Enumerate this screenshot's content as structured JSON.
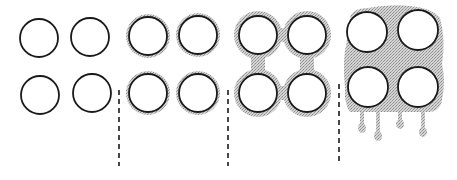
{
  "diagram": {
    "colors": {
      "stroke": "#1a1a1a",
      "fill_shade": "#b8b8b8",
      "background": "#ffffff"
    },
    "stages": [
      {
        "id": "stage-1",
        "label": "dry",
        "circles": [
          [
            39,
            38
          ],
          [
            90,
            37
          ],
          [
            40,
            95
          ],
          [
            92,
            93
          ]
        ],
        "radius": 19
      },
      {
        "id": "stage-2",
        "label": "thin-film",
        "circles": [
          [
            148,
            36
          ],
          [
            198,
            35
          ],
          [
            148,
            93
          ],
          [
            198,
            93
          ]
        ],
        "radius": 19
      },
      {
        "id": "stage-3",
        "label": "bridging",
        "circles": [
          [
            258,
            35
          ],
          [
            307,
            35
          ],
          [
            258,
            93
          ],
          [
            307,
            93
          ]
        ],
        "radius": 19
      },
      {
        "id": "stage-4",
        "label": "flooded-dripping",
        "circles": [
          [
            367,
            32
          ],
          [
            418,
            30
          ],
          [
            368,
            87
          ],
          [
            418,
            87
          ]
        ],
        "radius": 20,
        "drips": [
          [
            362,
            128
          ],
          [
            378,
            136
          ],
          [
            400,
            124
          ],
          [
            423,
            132
          ]
        ]
      }
    ],
    "separators": [
      {
        "x": 119,
        "y1": 90,
        "y2": 166
      },
      {
        "x": 228,
        "y1": 90,
        "y2": 166
      },
      {
        "x": 339,
        "y1": 84,
        "y2": 164
      }
    ]
  }
}
